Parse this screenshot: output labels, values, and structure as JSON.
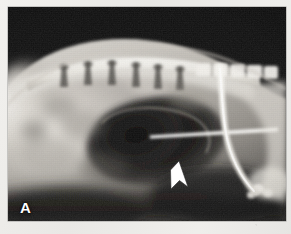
{
  "figure": {
    "domain_kind": "radiograph",
    "modality": "x-ray",
    "view": "lateral",
    "panel_letter": "A",
    "caption_text": ""
  },
  "annotations": {
    "panel_label": {
      "name": "panel-letter",
      "text": "A",
      "color": "#ffffff",
      "position": "bottom-left"
    },
    "arrow": {
      "name": "arrow-marker",
      "text": "",
      "color": "#ffffff",
      "direction": "up",
      "position": "center-lower",
      "points_at": "gas-filled viscus margin"
    }
  },
  "instruments": [
    {
      "name": "needle",
      "label": "",
      "appearance": "radiopaque straight tapered line",
      "color": "#fdfdfb",
      "orientation": "horizontal"
    },
    {
      "name": "tube",
      "label": "",
      "appearance": "radiopaque curved catheter",
      "color": "#f4f3ef",
      "orientation": "vertical-curving"
    }
  ],
  "anatomy": {
    "spine_label": "",
    "soft_tissue_label": "",
    "gas_shadow_label": ""
  },
  "palette": {
    "paper": "#eceae7",
    "film_dark": "#141414",
    "film_mid": "#6e6b66",
    "film_bright": "#f7f6f2",
    "annotation": "#ffffff"
  }
}
